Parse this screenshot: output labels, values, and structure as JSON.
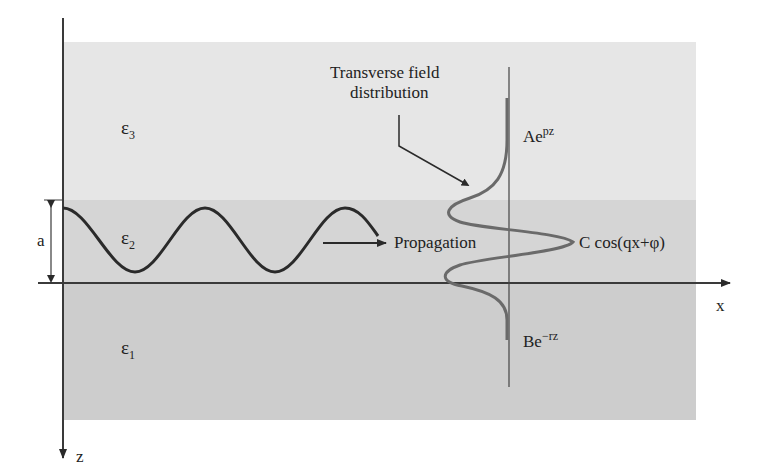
{
  "diagram": {
    "colors": {
      "background": "#ffffff",
      "layer_top": "#e6e6e6",
      "layer_middle": "#d5d5d5",
      "layer_bottom": "#cdcdcd",
      "axis": "#3a3a3a",
      "wave": "#2a2a2a",
      "field_curve": "#6a6a6a",
      "text": "#222222"
    },
    "axes": {
      "x_label": "x",
      "z_label": "z"
    },
    "layers": [
      {
        "name": "top-cladding",
        "epsilon_symbol": "ε",
        "epsilon_sub": "3",
        "field_expr_base": "Ae",
        "field_expr_sup": "pz"
      },
      {
        "name": "core",
        "epsilon_symbol": "ε",
        "epsilon_sub": "2",
        "field_expr": "C cos(qx+φ)",
        "thickness_label": "a"
      },
      {
        "name": "substrate",
        "epsilon_symbol": "ε",
        "epsilon_sub": "1",
        "field_expr_base": "Be",
        "field_expr_sup": "−rz"
      }
    ],
    "annotations": {
      "transverse_line1": "Transverse field",
      "transverse_line2": "distribution",
      "propagation": "Propagation"
    }
  }
}
